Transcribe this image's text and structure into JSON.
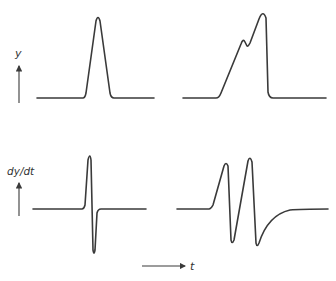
{
  "labels": {
    "y_axis": "y",
    "dydt_axis": "dy/dt",
    "t_axis": "t"
  },
  "panels": [
    {
      "id": "top-left",
      "description": "single symmetric peak of y vs t"
    },
    {
      "id": "top-right",
      "description": "asymmetric peak with shoulder of y vs t"
    },
    {
      "id": "bottom-left",
      "description": "first derivative of single peak: one positive and one negative lobe"
    },
    {
      "id": "bottom-right",
      "description": "first derivative of shouldered peak: two positive and two negative lobes with exponential recovery"
    }
  ],
  "colors": {
    "line": "#3a3a3a",
    "background": "#ffffff"
  }
}
